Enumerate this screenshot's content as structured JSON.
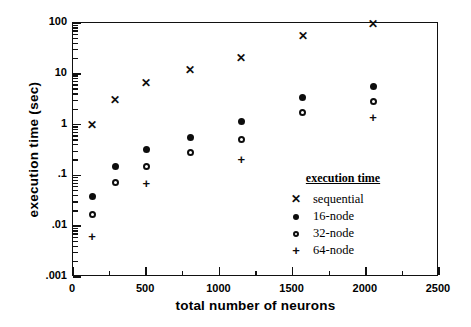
{
  "chart_data": {
    "type": "scatter",
    "title": "",
    "xlabel": "total number of neurons",
    "ylabel": "execution time  (sec)",
    "xlim": [
      0,
      2500
    ],
    "ylim": [
      0.001,
      100
    ],
    "yscale": "log",
    "xscale": "linear",
    "grid": false,
    "legend_position": "inside-right",
    "legend_title": "execution time",
    "xticks": [
      0,
      500,
      1000,
      1500,
      2000,
      2500
    ],
    "xtick_labels": [
      "0",
      "500",
      "1000",
      "1500",
      "2000",
      "2500"
    ],
    "xminor_step": 250,
    "yticks": [
      100,
      10,
      1,
      0.1,
      0.01,
      0.001
    ],
    "ytick_labels": [
      "100",
      "10",
      "1",
      ".1",
      ".01",
      ".001"
    ],
    "x": [
      130,
      290,
      500,
      800,
      1150,
      1570,
      2050
    ],
    "series": [
      {
        "name": "sequential",
        "marker": "x",
        "x": [
          130,
          290,
          500,
          800,
          1150,
          1570,
          2050
        ],
        "values": [
          0.95,
          3.0,
          6.3,
          11.5,
          20.0,
          55.0,
          92.0
        ]
      },
      {
        "name": "16-node",
        "marker": "filled-circle",
        "x": [
          130,
          290,
          500,
          800,
          1150,
          1570,
          2050
        ],
        "values": [
          0.038,
          0.15,
          0.32,
          0.57,
          1.15,
          3.4,
          5.5
        ]
      },
      {
        "name": "32-node",
        "marker": "open-circle",
        "x": [
          130,
          290,
          500,
          800,
          1150,
          1570,
          2050
        ],
        "values": [
          0.017,
          0.072,
          0.15,
          0.28,
          0.5,
          1.75,
          2.8
        ]
      },
      {
        "name": "64-node",
        "marker": "plus",
        "x": [
          130,
          500,
          1150,
          2050
        ],
        "values": [
          0.0062,
          0.07,
          0.21,
          1.4
        ]
      }
    ]
  },
  "legend": {
    "title": "execution time",
    "entries": [
      {
        "marker": "x",
        "label": "sequential"
      },
      {
        "marker": "filled-circle",
        "label": "16-node"
      },
      {
        "marker": "open-circle",
        "label": "32-node"
      },
      {
        "marker": "plus",
        "label": "64-node"
      }
    ]
  },
  "axes": {
    "x_title": "total number of neurons",
    "y_title": "execution time  (sec)"
  },
  "colors": {
    "foreground": "#0d0d0d",
    "background": "#ffffff",
    "axis": "#111111"
  }
}
